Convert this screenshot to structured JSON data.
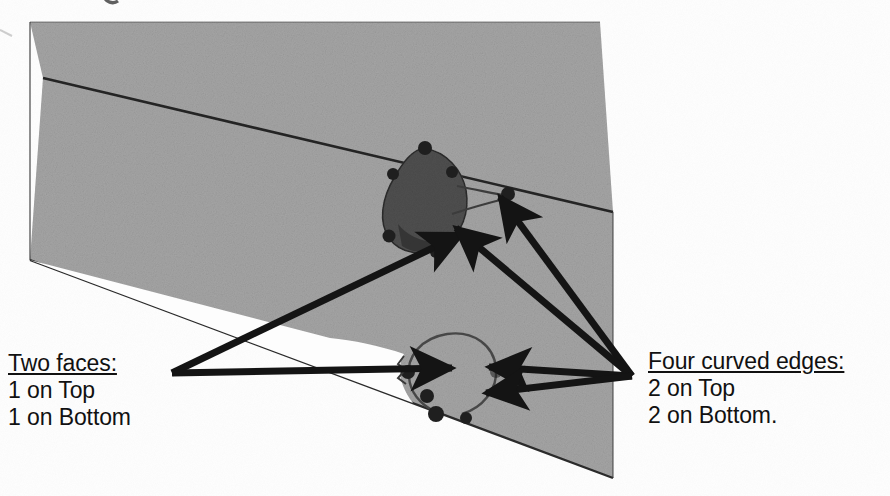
{
  "figure": {
    "kind": "scanned-technical-illustration",
    "background_color": "#fdfdfd",
    "solid_fill_color": "#a5a5a5",
    "solid_edge_color": "#2b2b2b",
    "annotation_color": "#111111",
    "pocket_dark_color": "#4a4a4a"
  },
  "callouts": {
    "left": {
      "name": "two-faces-callout",
      "heading": "Two faces:",
      "lines": [
        "1 on Top",
        "1 on Bottom"
      ],
      "arrow_count": 2,
      "apex": {
        "x": 172,
        "y": 373
      }
    },
    "right": {
      "name": "four-curved-edges-callout",
      "heading": "Four curved edges:",
      "lines": [
        "2 on Top",
        "2 on Bottom."
      ],
      "arrow_count": 4,
      "apex": {
        "x": 632,
        "y": 376
      }
    }
  },
  "geometry": {
    "slab": {
      "top_band_points": "30,22 600,22 613,212 43,78",
      "front_face_points": "43,78 613,212 613,478 30,260",
      "left_edge": {
        "x1": 30,
        "y1": 22,
        "x2": 30,
        "y2": 260
      },
      "right_edge": {
        "x1": 613,
        "y1": 212,
        "x2": 613,
        "y2": 478
      }
    },
    "upper_pocket": {
      "label": "upper-machined-pocket",
      "center": {
        "x": 432,
        "y": 200
      },
      "radius": 40
    },
    "lower_pocket": {
      "label": "lower-machined-pocket",
      "center": {
        "x": 450,
        "y": 385
      },
      "radius": 48
    }
  },
  "arrows": {
    "left_cluster": [
      {
        "name": "arrow-to-upper-face",
        "from": {
          "x": 172,
          "y": 373
        },
        "to": {
          "x": 468,
          "y": 231
        }
      },
      {
        "name": "arrow-to-lower-face",
        "from": {
          "x": 172,
          "y": 373
        },
        "to": {
          "x": 458,
          "y": 368
        }
      }
    ],
    "right_cluster": [
      {
        "name": "arrow-to-upper-edge-far",
        "from": {
          "x": 632,
          "y": 376
        },
        "to": {
          "x": 497,
          "y": 193
        }
      },
      {
        "name": "arrow-to-upper-edge-near",
        "from": {
          "x": 632,
          "y": 376
        },
        "to": {
          "x": 452,
          "y": 226
        }
      },
      {
        "name": "arrow-to-lower-edge-right",
        "from": {
          "x": 632,
          "y": 376
        },
        "to": {
          "x": 483,
          "y": 368
        }
      },
      {
        "name": "arrow-to-lower-edge-down",
        "from": {
          "x": 632,
          "y": 376
        },
        "to": {
          "x": 480,
          "y": 395
        }
      }
    ]
  }
}
